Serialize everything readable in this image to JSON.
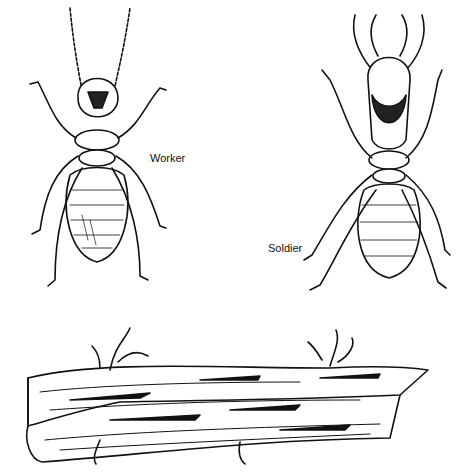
{
  "figure": {
    "labels": {
      "worker": "Worker",
      "soldier": "Soldier"
    },
    "subjects": [
      "worker termite",
      "soldier termite",
      "termite-damaged wood"
    ]
  }
}
